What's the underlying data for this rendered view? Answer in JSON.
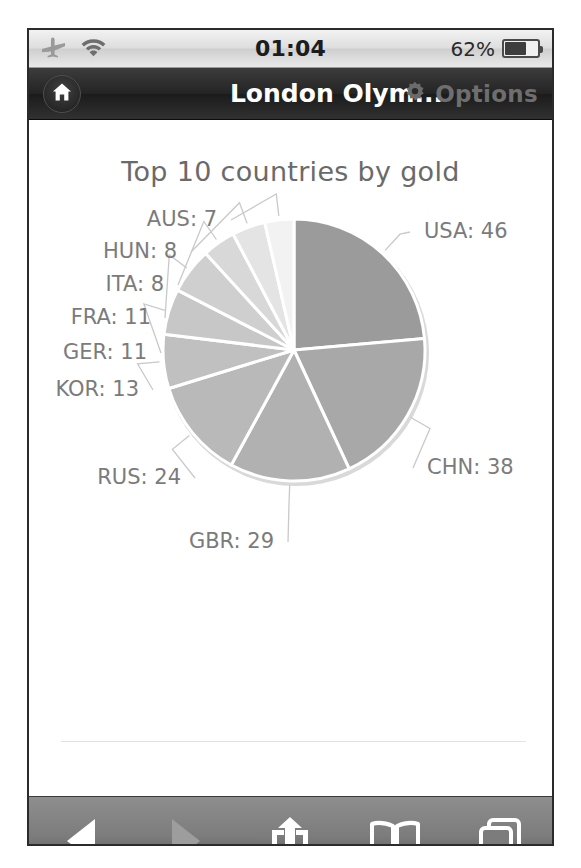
{
  "statusbar": {
    "airplane_icon": "airplane-icon",
    "wifi_icon": "wifi-icon",
    "time": "01:04",
    "battery_text": "62%",
    "battery_icon": "battery-icon",
    "battery_percent": 62
  },
  "navbar": {
    "home_icon": "home-icon",
    "title": "London Olym...",
    "gear_icon": "gear-icon",
    "options_label": "Options"
  },
  "toolbar": {
    "back_label": "Back",
    "forward_label": "Forward",
    "share_label": "Share",
    "bookmarks_label": "Bookmarks",
    "tabs_label": "Tabs"
  },
  "colors": {
    "navbar_bg": "#242424",
    "statusbar_bg": "#dedede",
    "toolbar_bg": "#7c7c7c",
    "label_text": "#7b7b7b",
    "title_text": "#6a6a6a",
    "slice_colors": [
      "#9b9b9b",
      "#a8a8a8",
      "#b1b1b1",
      "#b9b9b9",
      "#c0c0c0",
      "#c7c7c7",
      "#cfcfcf",
      "#d8d8d8",
      "#e4e4e4",
      "#f2f2f2"
    ]
  },
  "chart_data": {
    "type": "pie",
    "title": "Top 10 countries by gold",
    "xlabel": "",
    "ylabel": "",
    "legend_position": "labels-outside",
    "grid": false,
    "start_angle_deg": 0,
    "direction": "clockwise",
    "categories": [
      "USA",
      "CHN",
      "GBR",
      "RUS",
      "KOR",
      "GER",
      "FRA",
      "ITA",
      "HUN",
      "AUS"
    ],
    "values": [
      46,
      38,
      29,
      24,
      13,
      11,
      11,
      8,
      8,
      7
    ],
    "total": 195,
    "labels": [
      "USA: 46",
      "CHN: 38",
      "GBR: 29",
      "RUS: 24",
      "KOR: 13",
      "GER: 11",
      "FRA: 11",
      "ITA: 8",
      "HUN: 8",
      "AUS: 7"
    ]
  }
}
